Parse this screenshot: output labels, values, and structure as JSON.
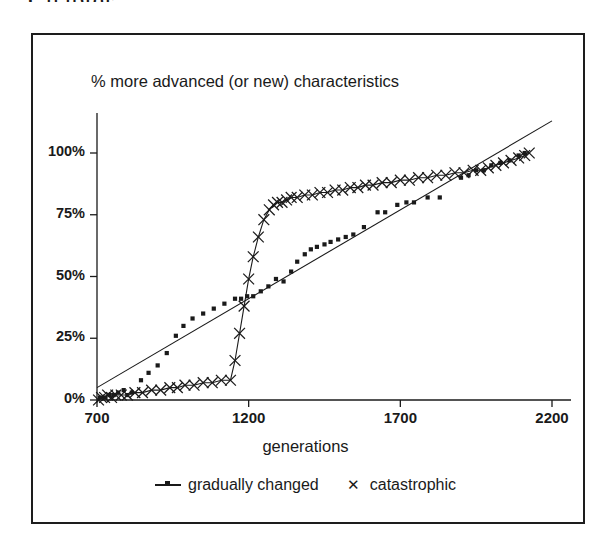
{
  "scan_artifact": {
    "top_fragment": "Chapter"
  },
  "figure": {
    "title": "% more advanced (or new) characteristics",
    "xlabel": "generations",
    "frame": "rectangular-border"
  },
  "legend": {
    "position": "bottom-center",
    "entries": [
      {
        "label": "gradually changed",
        "marker": "small-filled-square-with-line",
        "icon": "legend-line-square-icon"
      },
      {
        "label": "catastrophic",
        "marker": "x-cross",
        "icon": "legend-x-icon"
      }
    ]
  },
  "chart_data": {
    "type": "scatter",
    "title": "% more advanced (or new) characteristics",
    "xlabel": "generations",
    "ylabel": "",
    "xlim": [
      700,
      2200
    ],
    "ylim": [
      0,
      115
    ],
    "grid": false,
    "legend_position": "bottom-center",
    "xticks": [
      700,
      1200,
      1700,
      2200
    ],
    "xtick_labels": [
      "700",
      "1200",
      "1700",
      "2200"
    ],
    "yticks": [
      0,
      25,
      50,
      75,
      100
    ],
    "ytick_labels": [
      "0%",
      "25%",
      "50%",
      "75%",
      "100%"
    ],
    "series": [
      {
        "name": "gradually changed",
        "marker": "square",
        "color": "#1a1a1a",
        "trendline": {
          "type": "linear",
          "x": [
            700,
            2200
          ],
          "y": [
            5,
            113
          ]
        },
        "points": [
          {
            "x": 710,
            "y": 1
          },
          {
            "x": 728,
            "y": 1
          },
          {
            "x": 742,
            "y": 2
          },
          {
            "x": 755,
            "y": 2
          },
          {
            "x": 770,
            "y": 3
          },
          {
            "x": 788,
            "y": 4
          },
          {
            "x": 800,
            "y": 2
          },
          {
            "x": 815,
            "y": 3
          },
          {
            "x": 845,
            "y": 8
          },
          {
            "x": 870,
            "y": 11
          },
          {
            "x": 900,
            "y": 14
          },
          {
            "x": 930,
            "y": 19
          },
          {
            "x": 960,
            "y": 26
          },
          {
            "x": 985,
            "y": 30
          },
          {
            "x": 1015,
            "y": 33
          },
          {
            "x": 1050,
            "y": 35
          },
          {
            "x": 1085,
            "y": 37
          },
          {
            "x": 1120,
            "y": 39
          },
          {
            "x": 1155,
            "y": 41
          },
          {
            "x": 1175,
            "y": 41
          },
          {
            "x": 1195,
            "y": 42
          },
          {
            "x": 1215,
            "y": 42
          },
          {
            "x": 1240,
            "y": 44
          },
          {
            "x": 1265,
            "y": 46
          },
          {
            "x": 1290,
            "y": 49
          },
          {
            "x": 1315,
            "y": 48
          },
          {
            "x": 1340,
            "y": 52
          },
          {
            "x": 1360,
            "y": 56
          },
          {
            "x": 1385,
            "y": 59
          },
          {
            "x": 1405,
            "y": 61
          },
          {
            "x": 1425,
            "y": 62
          },
          {
            "x": 1450,
            "y": 63
          },
          {
            "x": 1470,
            "y": 64
          },
          {
            "x": 1495,
            "y": 65
          },
          {
            "x": 1520,
            "y": 66
          },
          {
            "x": 1545,
            "y": 67
          },
          {
            "x": 1580,
            "y": 70
          },
          {
            "x": 1625,
            "y": 76
          },
          {
            "x": 1650,
            "y": 76
          },
          {
            "x": 1690,
            "y": 79
          },
          {
            "x": 1720,
            "y": 80
          },
          {
            "x": 1745,
            "y": 80
          },
          {
            "x": 1790,
            "y": 82
          },
          {
            "x": 1830,
            "y": 82
          },
          {
            "x": 1900,
            "y": 90
          },
          {
            "x": 1925,
            "y": 91
          },
          {
            "x": 1950,
            "y": 93
          },
          {
            "x": 1975,
            "y": 93
          },
          {
            "x": 2000,
            "y": 95
          },
          {
            "x": 2030,
            "y": 96
          },
          {
            "x": 2060,
            "y": 97
          },
          {
            "x": 2090,
            "y": 99
          },
          {
            "x": 2110,
            "y": 100
          }
        ]
      },
      {
        "name": "catastrophic",
        "marker": "x",
        "color": "#1a1a1a",
        "connected": true,
        "points": [
          {
            "x": 705,
            "y": 0
          },
          {
            "x": 715,
            "y": 1
          },
          {
            "x": 725,
            "y": 1
          },
          {
            "x": 735,
            "y": 2
          },
          {
            "x": 748,
            "y": 1
          },
          {
            "x": 762,
            "y": 2
          },
          {
            "x": 780,
            "y": 2
          },
          {
            "x": 800,
            "y": 2
          },
          {
            "x": 825,
            "y": 3
          },
          {
            "x": 850,
            "y": 3
          },
          {
            "x": 880,
            "y": 4
          },
          {
            "x": 910,
            "y": 4
          },
          {
            "x": 940,
            "y": 5
          },
          {
            "x": 965,
            "y": 5
          },
          {
            "x": 990,
            "y": 6
          },
          {
            "x": 1020,
            "y": 6
          },
          {
            "x": 1050,
            "y": 7
          },
          {
            "x": 1080,
            "y": 7
          },
          {
            "x": 1110,
            "y": 8
          },
          {
            "x": 1140,
            "y": 8
          },
          {
            "x": 1155,
            "y": 16
          },
          {
            "x": 1170,
            "y": 27
          },
          {
            "x": 1185,
            "y": 38
          },
          {
            "x": 1200,
            "y": 49
          },
          {
            "x": 1215,
            "y": 58
          },
          {
            "x": 1232,
            "y": 66
          },
          {
            "x": 1250,
            "y": 73
          },
          {
            "x": 1268,
            "y": 77
          },
          {
            "x": 1282,
            "y": 79
          },
          {
            "x": 1295,
            "y": 80
          },
          {
            "x": 1310,
            "y": 80
          },
          {
            "x": 1325,
            "y": 81
          },
          {
            "x": 1340,
            "y": 82
          },
          {
            "x": 1360,
            "y": 82
          },
          {
            "x": 1385,
            "y": 83
          },
          {
            "x": 1410,
            "y": 83
          },
          {
            "x": 1435,
            "y": 84
          },
          {
            "x": 1460,
            "y": 84
          },
          {
            "x": 1485,
            "y": 85
          },
          {
            "x": 1510,
            "y": 85
          },
          {
            "x": 1535,
            "y": 86
          },
          {
            "x": 1560,
            "y": 86
          },
          {
            "x": 1585,
            "y": 87
          },
          {
            "x": 1610,
            "y": 87
          },
          {
            "x": 1640,
            "y": 88
          },
          {
            "x": 1670,
            "y": 88
          },
          {
            "x": 1700,
            "y": 89
          },
          {
            "x": 1730,
            "y": 89
          },
          {
            "x": 1760,
            "y": 90
          },
          {
            "x": 1790,
            "y": 90
          },
          {
            "x": 1820,
            "y": 91
          },
          {
            "x": 1850,
            "y": 91
          },
          {
            "x": 1880,
            "y": 92
          },
          {
            "x": 1910,
            "y": 92
          },
          {
            "x": 1940,
            "y": 93
          },
          {
            "x": 1965,
            "y": 93
          },
          {
            "x": 1990,
            "y": 94
          },
          {
            "x": 2015,
            "y": 95
          },
          {
            "x": 2040,
            "y": 96
          },
          {
            "x": 2065,
            "y": 97
          },
          {
            "x": 2090,
            "y": 98
          },
          {
            "x": 2110,
            "y": 99
          },
          {
            "x": 2125,
            "y": 100
          }
        ]
      }
    ]
  }
}
